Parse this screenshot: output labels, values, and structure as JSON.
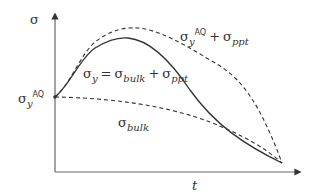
{
  "diagram": {
    "type": "line-sketch",
    "axes": {
      "y_label": "σ",
      "x_label": "t",
      "y_tick_label": {
        "base": "σ",
        "sub": "y",
        "sup": "AQ"
      }
    },
    "curves": [
      {
        "name": "total-upper",
        "style": "dashed",
        "label": {
          "base": "σ",
          "sub": "y",
          "sup": "AQ",
          "op": "+",
          "base2": "σ",
          "sub2": "ppt"
        }
      },
      {
        "name": "yield",
        "style": "solid",
        "label": {
          "base": "σ",
          "sub": "y",
          "eq": "=",
          "base2": "σ",
          "sub2": "bulk",
          "op": "+",
          "base3": "σ",
          "sub3": "ppt"
        }
      },
      {
        "name": "bulk",
        "style": "dashed",
        "label": {
          "base": "σ",
          "sub": "bulk"
        }
      }
    ],
    "colors": {
      "line": "#333333",
      "axis": "#555555"
    }
  }
}
